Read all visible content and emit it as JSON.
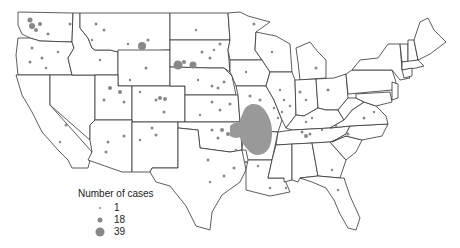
{
  "map": {
    "region": "Contiguous United States",
    "symbol": "proportional-circle",
    "dot_color": "#888888",
    "border_color": "#333333"
  },
  "legend": {
    "title": "Number of cases",
    "items": [
      {
        "label": "1",
        "size": 2
      },
      {
        "label": "18",
        "size": 5
      },
      {
        "label": "39",
        "size": 9
      }
    ]
  }
}
